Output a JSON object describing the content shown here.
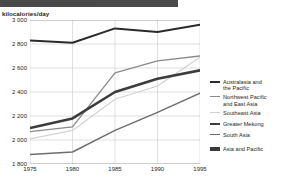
{
  "header": {
    "title_banner": "Trends in food consumption per person",
    "unit_label": "kilocalories/day"
  },
  "chart_data": {
    "type": "line",
    "title": "Trends in food consumption per person",
    "xlabel": "",
    "ylabel": "kilocalories/day",
    "x": [
      1975,
      1980,
      1985,
      1990,
      1995
    ],
    "xticklabels": [
      "1975",
      "1980",
      "1985",
      "1990",
      "1995"
    ],
    "xlim": [
      1975,
      1995
    ],
    "ylim": [
      1800,
      3000
    ],
    "yticks": [
      1800,
      2000,
      2200,
      2400,
      2600,
      2800,
      3000
    ],
    "yticklabels": [
      "1 800",
      "2 000",
      "2 200",
      "2 400",
      "2 600",
      "2 800",
      "3 000"
    ],
    "grid": true,
    "legend_position": "right",
    "series": [
      {
        "name": "Australasia and\nthe Pacific",
        "label": "Australasia and the Pacific",
        "color": "#2b2b2b",
        "width": 2.0,
        "values": [
          2830,
          2810,
          2930,
          2900,
          2960
        ]
      },
      {
        "name": "Northwest Pacific\nand East Asia",
        "label": "Northwest Pacific and East Asia",
        "color": "#8a8a8a",
        "width": 1.3,
        "values": [
          2070,
          2110,
          2560,
          2660,
          2700
        ]
      },
      {
        "name": "Southeast Asia",
        "label": "Southeast Asia",
        "color": "#d2d2d2",
        "width": 1.2,
        "values": [
          2010,
          2080,
          2340,
          2450,
          2690
        ]
      },
      {
        "name": "Greater Mekong",
        "label": "Greater Mekong",
        "color": "#3c3c3c",
        "width": 2.6,
        "values": [
          2100,
          2180,
          2400,
          2510,
          2580
        ]
      },
      {
        "name": "South Asia",
        "label": "South Asia",
        "color": "#6e6e6e",
        "width": 1.5,
        "values": [
          1880,
          1900,
          2080,
          2230,
          2390
        ]
      }
    ],
    "extra_legend": [
      {
        "name": "Asia and Pacific",
        "color": "#3a3a3a",
        "style": "block"
      }
    ],
    "colors": {
      "grid": "#c9c9c9",
      "axis": "#8d8d8d",
      "text": "#231f20",
      "background": "#ffffff",
      "banner": "#4a4a4a"
    }
  }
}
